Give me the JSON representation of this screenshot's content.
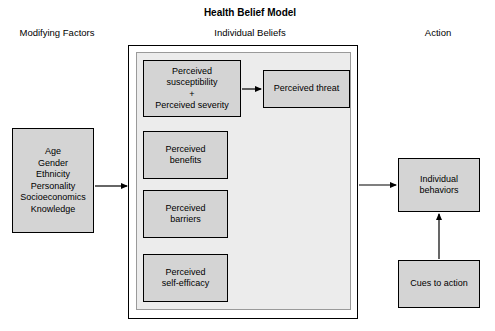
{
  "diagram": {
    "title": "Health Belief Model",
    "columns": {
      "modifying_factors": "Modifying Factors",
      "individual_beliefs": "Individual Beliefs",
      "action": "Action"
    },
    "modifying_factors_box": {
      "lines": [
        "Age",
        "Gender",
        "Ethnicity",
        "Personality",
        "Socioeconomics",
        "Knowledge"
      ]
    },
    "beliefs": [
      {
        "name": "susceptibility-severity",
        "lines": [
          "Perceived",
          "susceptibility",
          "+",
          "Perceived severity"
        ]
      },
      {
        "name": "benefits",
        "lines": [
          "Perceived",
          "benefits"
        ]
      },
      {
        "name": "barriers",
        "lines": [
          "Perceived",
          "barriers"
        ]
      },
      {
        "name": "self-efficacy",
        "lines": [
          "Perceived",
          "self-efficacy"
        ]
      }
    ],
    "perceived_threat_box": {
      "lines": [
        "Perceived threat"
      ]
    },
    "individual_behaviors_box": {
      "lines": [
        "Individual",
        "behaviors"
      ]
    },
    "cues_to_action_box": {
      "lines": [
        "Cues to action"
      ]
    },
    "colors": {
      "box_fill": "#d4d4d4",
      "panel_fill": "#ececec",
      "stroke": "#000000"
    }
  }
}
